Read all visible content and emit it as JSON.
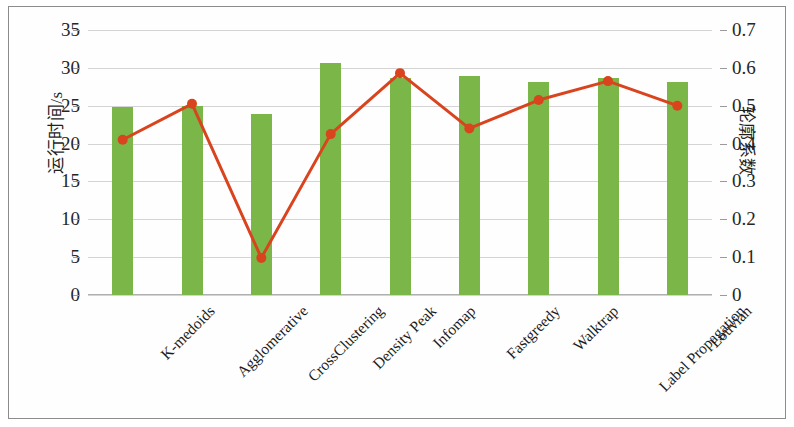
{
  "chart_data": {
    "type": "bar",
    "title": "",
    "xlabel": "",
    "categories": [
      "K-medoids",
      "Agglomerative",
      "CrossClustering",
      "Density Peak",
      "Infomap",
      "Fastgreedy",
      "Walktrap",
      "Label Propagation",
      "Louvian"
    ],
    "series": [
      {
        "name": "运行时间/s",
        "type": "bar",
        "axis": "left",
        "color": "#7ab648",
        "values": [
          24.8,
          25.0,
          23.9,
          30.7,
          28.6,
          28.9,
          28.1,
          28.6,
          28.1
        ]
      },
      {
        "name": "轮廓系数",
        "type": "line",
        "axis": "right",
        "color": "#d9441f",
        "values": [
          0.41,
          0.505,
          0.098,
          0.425,
          0.586,
          0.44,
          0.515,
          0.565,
          0.5
        ]
      }
    ],
    "left_axis": {
      "label": "运行时间/s",
      "ticks": [
        "0",
        "5",
        "10",
        "15",
        "20",
        "25",
        "30",
        "35"
      ],
      "min": 0,
      "max": 35
    },
    "right_axis": {
      "label": "轮廓系数",
      "ticks": [
        "0",
        "0.1",
        "0.2",
        "0.3",
        "0.4",
        "0.5",
        "0.6",
        "0.7"
      ],
      "min": 0,
      "max": 0.7
    },
    "grid": true,
    "legend_position": "none",
    "colors": {
      "bar": "#7ab648",
      "line": "#d9441f",
      "grid": "#d4d4d4",
      "frame": "#8c8c8c"
    }
  }
}
